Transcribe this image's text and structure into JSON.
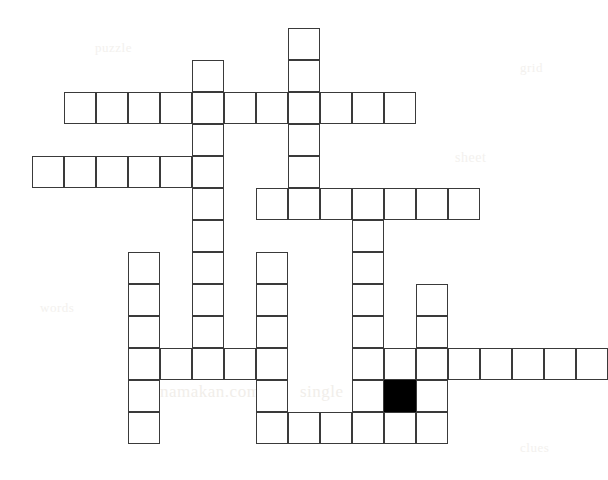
{
  "puzzle": {
    "title": "Crossword Puzzle Grid",
    "grid": {
      "cell_size": 32,
      "origin_x": 32,
      "origin_y": 28,
      "columns": 18,
      "rows": 14,
      "border_color": "#3a3a3a",
      "empty_color": "#ffffff",
      "filled_color": "#000000",
      "background_color": "#ffffff"
    },
    "counts": {
      "total_cells": 78,
      "open_cells": 77,
      "filled_cells": 1
    },
    "filled_cells": [
      {
        "row": 11,
        "col": 11
      }
    ],
    "rows": [
      {
        "row": 0,
        "y": 28,
        "cols": [
          8
        ]
      },
      {
        "row": 1,
        "y": 60,
        "cols": [
          5,
          8
        ]
      },
      {
        "row": 2,
        "y": 92,
        "cols": [
          1,
          2,
          3,
          4,
          5,
          6,
          7,
          8,
          9,
          10,
          11
        ]
      },
      {
        "row": 3,
        "y": 124,
        "cols": [
          5,
          8
        ]
      },
      {
        "row": 4,
        "y": 156,
        "cols": [
          0,
          1,
          2,
          3,
          4,
          5,
          8
        ]
      },
      {
        "row": 5,
        "y": 188,
        "cols": [
          5,
          7,
          8,
          9,
          10,
          11,
          12,
          13
        ]
      },
      {
        "row": 6,
        "y": 220,
        "cols": [
          5,
          10
        ]
      },
      {
        "row": 7,
        "y": 256,
        "cols": [
          3,
          5,
          7,
          10
        ]
      },
      {
        "row": 8,
        "y": 288,
        "cols": [
          3,
          5,
          7,
          10,
          12
        ]
      },
      {
        "row": 9,
        "y": 320,
        "cols": [
          3,
          5,
          7,
          10,
          12
        ]
      },
      {
        "row": 10,
        "y": 352,
        "cols": [
          3,
          4,
          5,
          6,
          7,
          10,
          11,
          12,
          13,
          14,
          15,
          16,
          17
        ]
      },
      {
        "row": 11,
        "y": 384,
        "cols": [
          3,
          7,
          10,
          11,
          12
        ]
      },
      {
        "row": 12,
        "y": 416,
        "cols": [
          3,
          7,
          8,
          9,
          10,
          11,
          12
        ]
      }
    ],
    "entries": {
      "across": [
        {
          "row": 2,
          "start_col": 1,
          "length": 11
        },
        {
          "row": 4,
          "start_col": 0,
          "length": 6
        },
        {
          "row": 5,
          "start_col": 7,
          "length": 7
        },
        {
          "row": 10,
          "start_col": 3,
          "length": 5
        },
        {
          "row": 10,
          "start_col": 10,
          "length": 8
        },
        {
          "row": 12,
          "start_col": 7,
          "length": 6
        }
      ],
      "down": [
        {
          "col": 8,
          "start_row": 0,
          "length": 6
        },
        {
          "col": 5,
          "start_row": 1,
          "length": 10
        },
        {
          "col": 10,
          "start_row": 5,
          "length": 8
        },
        {
          "col": 3,
          "start_row": 7,
          "length": 6
        },
        {
          "col": 7,
          "start_row": 7,
          "length": 6
        },
        {
          "col": 12,
          "start_row": 8,
          "length": 5
        }
      ]
    },
    "watermarks": [
      {
        "text": "namakan.com",
        "x": 160,
        "y": 382,
        "size": 17,
        "color": "#f1eeea"
      },
      {
        "text": "single",
        "x": 300,
        "y": 382,
        "size": 17,
        "color": "#f1eeea"
      },
      {
        "text": "sheet",
        "x": 455,
        "y": 150,
        "size": 14,
        "color": "#f3f1ee"
      },
      {
        "text": "puzzle",
        "x": 95,
        "y": 40,
        "size": 13,
        "color": "#f3f1ee"
      },
      {
        "text": "grid",
        "x": 520,
        "y": 60,
        "size": 13,
        "color": "#f3f1ee"
      },
      {
        "text": "words",
        "x": 40,
        "y": 300,
        "size": 13,
        "color": "#f3f1ee"
      },
      {
        "text": "clues",
        "x": 520,
        "y": 440,
        "size": 13,
        "color": "#f3f1ee"
      }
    ]
  }
}
